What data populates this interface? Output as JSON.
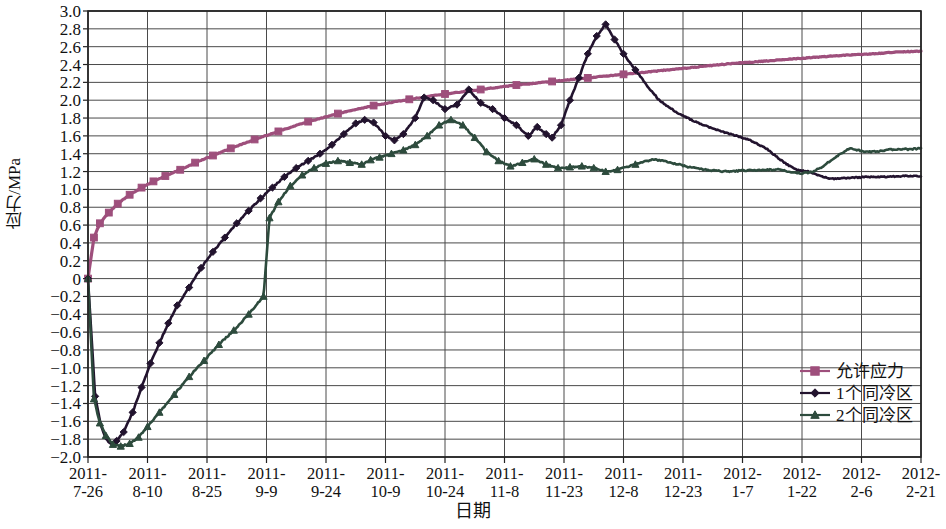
{
  "chart_data": {
    "type": "line",
    "title": "",
    "xlabel": "日期",
    "ylabel": "应力/MPa",
    "ylim": [
      -2.0,
      3.0
    ],
    "ytick_step": 0.2,
    "yticks": [
      "3.0",
      "2.8",
      "2.6",
      "2.4",
      "2.2",
      "2.0",
      "1.8",
      "1.6",
      "1.4",
      "1.2",
      "1.0",
      "0.8",
      "0.6",
      "0.4",
      "0.2",
      "0",
      "−0.2",
      "−0.4",
      "−0.6",
      "−0.8",
      "−1.0",
      "−1.2",
      "−1.4",
      "−1.6",
      "−1.8",
      "−2.0"
    ],
    "grid": true,
    "grid_x": true,
    "grid_y": true,
    "legend_position": "bottom-right",
    "categories": [
      "2011-7-26",
      "2011-8-10",
      "2011-8-25",
      "2011-9-9",
      "2011-9-24",
      "2011-10-9",
      "2011-10-24",
      "2011-11-8",
      "2011-11-23",
      "2011-12-8",
      "2011-12-23",
      "2012-1-7",
      "2012-1-22",
      "2012-2-6",
      "2012-2-21"
    ],
    "xtick_lines": [
      [
        "2011-",
        "7-26"
      ],
      [
        "2011-",
        "8-10"
      ],
      [
        "2011-",
        "8-25"
      ],
      [
        "2011-",
        "9-9"
      ],
      [
        "2011-",
        "9-24"
      ],
      [
        "2011-",
        "10-9"
      ],
      [
        "2011-",
        "10-24"
      ],
      [
        "2011-",
        "11-8"
      ],
      [
        "2011-",
        "11-23"
      ],
      [
        "2011-",
        "12-8"
      ],
      [
        "2011-",
        "12-23"
      ],
      [
        "2012-",
        "1-7"
      ],
      [
        "2012-",
        "1-22"
      ],
      [
        "2012-",
        "2-6"
      ],
      [
        "2012-",
        "2-21"
      ]
    ],
    "series": [
      {
        "name": "允许应力",
        "color": "#9e4f7c",
        "marker": "square",
        "x": [
          0.0,
          0.1,
          0.2,
          0.35,
          0.5,
          0.7,
          0.9,
          1.1,
          1.3,
          1.55,
          1.8,
          2.1,
          2.4,
          2.8,
          3.2,
          3.7,
          4.2,
          4.8,
          5.4,
          6.0,
          6.6,
          7.2,
          7.8,
          8.4,
          9.0,
          9.6,
          10.2,
          10.8,
          11.4,
          12.0,
          12.6,
          13.2,
          13.6,
          14.0
        ],
        "values": [
          0.0,
          0.46,
          0.62,
          0.74,
          0.84,
          0.94,
          1.02,
          1.09,
          1.15,
          1.22,
          1.3,
          1.38,
          1.46,
          1.56,
          1.65,
          1.76,
          1.85,
          1.94,
          2.01,
          2.07,
          2.12,
          2.17,
          2.21,
          2.25,
          2.29,
          2.33,
          2.37,
          2.41,
          2.44,
          2.47,
          2.5,
          2.52,
          2.54,
          2.55
        ]
      },
      {
        "name": "1个同冷区",
        "color": "#22132e",
        "marker": "diamond",
        "x": [
          0.0,
          0.12,
          0.22,
          0.3,
          0.38,
          0.48,
          0.6,
          0.75,
          0.9,
          1.05,
          1.2,
          1.35,
          1.5,
          1.7,
          1.9,
          2.1,
          2.3,
          2.5,
          2.7,
          2.9,
          3.1,
          3.3,
          3.5,
          3.7,
          3.9,
          4.1,
          4.3,
          4.5,
          4.65,
          4.8,
          5.0,
          5.15,
          5.3,
          5.5,
          5.65,
          5.8,
          6.0,
          6.2,
          6.4,
          6.6,
          6.8,
          7.0,
          7.2,
          7.4,
          7.55,
          7.7,
          7.8,
          7.95,
          8.1,
          8.25,
          8.4,
          8.55,
          8.7,
          8.85,
          9.0,
          9.2,
          9.4,
          9.6,
          9.9,
          10.2,
          10.5,
          10.8,
          11.1,
          11.4,
          11.7,
          11.9,
          12.1,
          12.3,
          12.5,
          12.8,
          13.1,
          13.4,
          13.7,
          14.0
        ],
        "values": [
          0.0,
          -1.32,
          -1.65,
          -1.8,
          -1.85,
          -1.82,
          -1.72,
          -1.5,
          -1.22,
          -0.95,
          -0.72,
          -0.5,
          -0.3,
          -0.1,
          0.12,
          0.3,
          0.46,
          0.62,
          0.76,
          0.9,
          1.02,
          1.14,
          1.24,
          1.32,
          1.4,
          1.5,
          1.62,
          1.74,
          1.78,
          1.75,
          1.6,
          1.55,
          1.62,
          1.8,
          2.03,
          2.0,
          1.9,
          1.95,
          2.12,
          1.97,
          1.9,
          1.8,
          1.72,
          1.6,
          1.7,
          1.62,
          1.58,
          1.72,
          2.0,
          2.25,
          2.52,
          2.72,
          2.85,
          2.68,
          2.52,
          2.34,
          2.16,
          2.0,
          1.86,
          1.76,
          1.68,
          1.62,
          1.56,
          1.46,
          1.3,
          1.22,
          1.2,
          1.15,
          1.12,
          1.13,
          1.14,
          1.14,
          1.15,
          1.15
        ]
      },
      {
        "name": "2个同冷区",
        "color": "#2d4b3d",
        "marker": "triangle",
        "x": [
          0.0,
          0.1,
          0.2,
          0.3,
          0.42,
          0.55,
          0.7,
          0.85,
          1.0,
          1.2,
          1.45,
          1.7,
          1.95,
          2.2,
          2.45,
          2.7,
          2.95,
          3.05,
          3.2,
          3.4,
          3.6,
          3.8,
          4.0,
          4.2,
          4.4,
          4.6,
          4.75,
          4.9,
          5.1,
          5.3,
          5.5,
          5.7,
          5.9,
          6.1,
          6.3,
          6.5,
          6.7,
          6.9,
          7.1,
          7.3,
          7.5,
          7.7,
          7.9,
          8.1,
          8.3,
          8.5,
          8.7,
          8.9,
          9.2,
          9.5,
          9.8,
          10.1,
          10.4,
          10.7,
          11.0,
          11.3,
          11.6,
          11.8,
          12.0,
          12.2,
          12.4,
          12.6,
          12.8,
          13.0,
          13.2,
          13.4,
          13.6,
          13.8,
          14.0
        ],
        "values": [
          0.0,
          -1.35,
          -1.62,
          -1.76,
          -1.86,
          -1.88,
          -1.85,
          -1.78,
          -1.66,
          -1.5,
          -1.3,
          -1.1,
          -0.92,
          -0.74,
          -0.58,
          -0.4,
          -0.2,
          0.68,
          0.86,
          1.04,
          1.16,
          1.24,
          1.29,
          1.32,
          1.3,
          1.28,
          1.33,
          1.36,
          1.4,
          1.44,
          1.5,
          1.6,
          1.72,
          1.78,
          1.72,
          1.58,
          1.42,
          1.32,
          1.26,
          1.3,
          1.34,
          1.28,
          1.24,
          1.25,
          1.26,
          1.24,
          1.2,
          1.22,
          1.28,
          1.34,
          1.3,
          1.25,
          1.22,
          1.2,
          1.21,
          1.22,
          1.22,
          1.2,
          1.18,
          1.2,
          1.28,
          1.38,
          1.46,
          1.43,
          1.42,
          1.44,
          1.45,
          1.45,
          1.46
        ]
      }
    ]
  },
  "legend": {
    "items": [
      {
        "label": "允许应力",
        "color": "#9e4f7c",
        "marker": "square"
      },
      {
        "label": "1个同冷区",
        "color": "#22132e",
        "marker": "diamond"
      },
      {
        "label": "2个同冷区",
        "color": "#2d4b3d",
        "marker": "triangle"
      }
    ]
  },
  "axes": {
    "y_title": "应力/MPa",
    "x_title": "日期"
  }
}
